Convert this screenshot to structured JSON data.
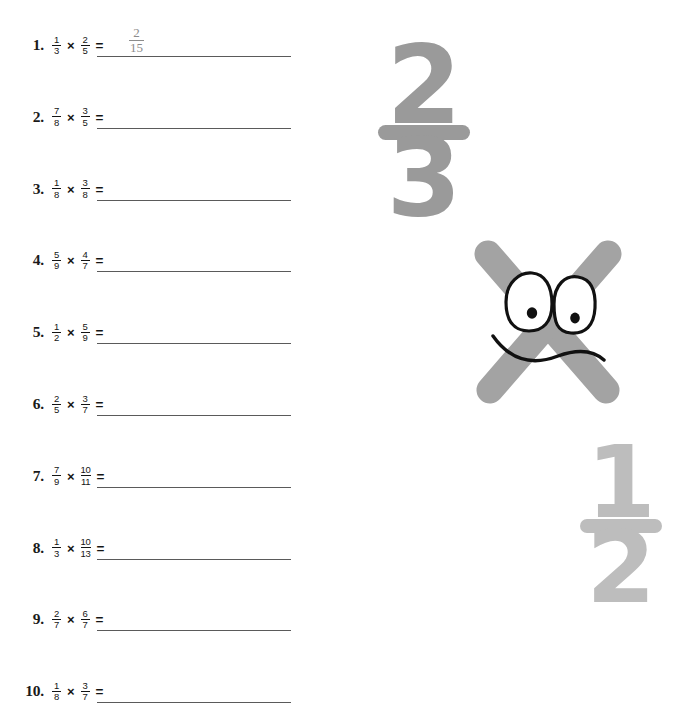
{
  "worksheet": {
    "operator": "×",
    "equals": "=",
    "problems": [
      {
        "index": "1.",
        "a_num": "1",
        "a_den": "3",
        "b_num": "2",
        "b_den": "5",
        "answer_num": "2",
        "answer_den": "15"
      },
      {
        "index": "2.",
        "a_num": "7",
        "a_den": "8",
        "b_num": "3",
        "b_den": "5",
        "answer_num": "",
        "answer_den": ""
      },
      {
        "index": "3.",
        "a_num": "1",
        "a_den": "8",
        "b_num": "3",
        "b_den": "8",
        "answer_num": "",
        "answer_den": ""
      },
      {
        "index": "4.",
        "a_num": "5",
        "a_den": "9",
        "b_num": "4",
        "b_den": "7",
        "answer_num": "",
        "answer_den": ""
      },
      {
        "index": "5.",
        "a_num": "1",
        "a_den": "2",
        "b_num": "5",
        "b_den": "9",
        "answer_num": "",
        "answer_den": ""
      },
      {
        "index": "6.",
        "a_num": "2",
        "a_den": "5",
        "b_num": "3",
        "b_den": "7",
        "answer_num": "",
        "answer_den": ""
      },
      {
        "index": "7.",
        "a_num": "7",
        "a_den": "9",
        "b_num": "10",
        "b_den": "11",
        "answer_num": "",
        "answer_den": ""
      },
      {
        "index": "8.",
        "a_num": "1",
        "a_den": "3",
        "b_num": "10",
        "b_den": "13",
        "answer_num": "",
        "answer_den": ""
      },
      {
        "index": "9.",
        "a_num": "2",
        "a_den": "7",
        "b_num": "6",
        "b_den": "7",
        "answer_num": "",
        "answer_den": ""
      },
      {
        "index": "10.",
        "a_num": "1",
        "a_den": "8",
        "b_num": "3",
        "b_den": "7",
        "answer_num": "",
        "answer_den": ""
      }
    ]
  },
  "decorations": {
    "fraction_two_thirds": {
      "numerator": "2",
      "denominator": "3",
      "color": "#9a9a9a"
    },
    "fraction_one_half": {
      "numerator": "1",
      "denominator": "2",
      "color": "#bdbdbd"
    },
    "x_mascot": {
      "label": "×",
      "color": "#a3a3a3",
      "eye_fill": "#ffffff",
      "outline": "#111111"
    }
  },
  "style": {
    "page_background": "#ffffff",
    "text_color": "#141414",
    "answer_line_color": "#5a5a5a",
    "answer_text_color": "#8c8c8c"
  }
}
